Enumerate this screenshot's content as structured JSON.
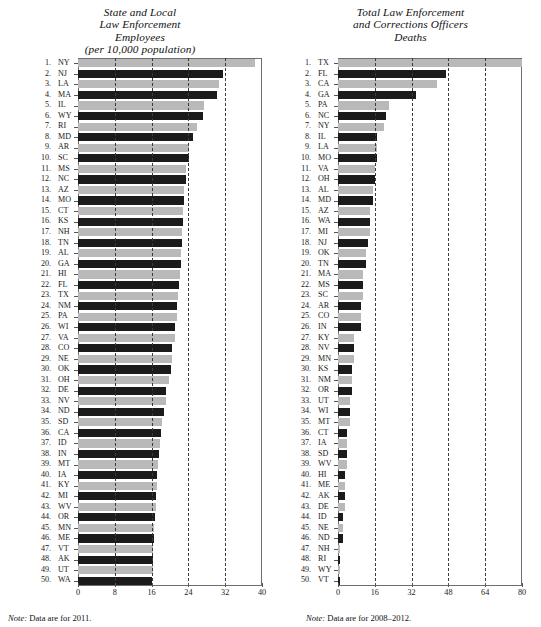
{
  "left_panel": {
    "title_lines": [
      "State and Local",
      "Law Enforcement",
      "Employees",
      "(per 10,000 population)"
    ],
    "note_label": "Note:",
    "note_text": " Data are for 2011."
  },
  "right_panel": {
    "title_lines": [
      "Total Law Enforcement",
      "and Corrections Officers",
      "Deaths"
    ],
    "note_label": "Note:",
    "note_text": " Data are for 2008–2012."
  },
  "chart_data": [
    {
      "type": "bar",
      "orientation": "horizontal",
      "title": "State and Local Law Enforcement Employees (per 10,000 population)",
      "xlabel": "",
      "ylabel": "",
      "xlim": [
        0,
        40
      ],
      "xticks": [
        0,
        8,
        16,
        24,
        32,
        40
      ],
      "grid": "vertical dashed at 8, 16, 24, 32",
      "legend": "none",
      "note": "Data are for 2011.",
      "categories": [
        "NY",
        "NJ",
        "LA",
        "MA",
        "IL",
        "WY",
        "RI",
        "MD",
        "AR",
        "SC",
        "MS",
        "NC",
        "AZ",
        "MO",
        "CT",
        "KS",
        "NH",
        "TN",
        "AL",
        "GA",
        "HI",
        "FL",
        "TX",
        "NM",
        "PA",
        "WI",
        "VA",
        "CO",
        "NE",
        "OK",
        "OH",
        "DE",
        "NV",
        "ND",
        "SD",
        "CA",
        "ID",
        "IN",
        "MT",
        "IA",
        "KY",
        "MI",
        "WV",
        "OR",
        "MN",
        "ME",
        "VT",
        "AK",
        "UT",
        "WA"
      ],
      "ranks": [
        1,
        2,
        3,
        4,
        5,
        6,
        7,
        8,
        9,
        10,
        11,
        12,
        13,
        14,
        15,
        16,
        17,
        18,
        19,
        20,
        21,
        22,
        23,
        24,
        25,
        26,
        27,
        28,
        29,
        30,
        31,
        32,
        33,
        34,
        35,
        36,
        37,
        38,
        39,
        40,
        41,
        42,
        43,
        44,
        45,
        46,
        47,
        48,
        49,
        50
      ],
      "values": [
        38.5,
        31.5,
        30.6,
        30.3,
        27.3,
        27.2,
        25.8,
        25.0,
        24.2,
        24.1,
        23.4,
        23.4,
        23.1,
        23.1,
        22.8,
        22.8,
        22.6,
        22.6,
        22.4,
        22.3,
        22.1,
        22.0,
        21.8,
        21.6,
        21.5,
        21.1,
        21.0,
        20.5,
        20.4,
        20.3,
        19.7,
        19.2,
        19.1,
        18.8,
        18.3,
        18.0,
        17.8,
        17.6,
        17.4,
        17.2,
        17.1,
        17.0,
        16.9,
        16.8,
        16.6,
        16.5,
        16.4,
        16.3,
        16.2,
        16.0
      ],
      "bar_shades": [
        "light",
        "dark",
        "light",
        "dark",
        "light",
        "dark",
        "light",
        "dark",
        "light",
        "dark",
        "light",
        "dark",
        "light",
        "dark",
        "light",
        "dark",
        "light",
        "dark",
        "light",
        "dark",
        "light",
        "dark",
        "light",
        "dark",
        "light",
        "dark",
        "light",
        "dark",
        "light",
        "dark",
        "light",
        "dark",
        "light",
        "dark",
        "light",
        "dark",
        "light",
        "dark",
        "light",
        "dark",
        "light",
        "dark",
        "light",
        "dark",
        "light",
        "dark",
        "light",
        "dark",
        "light",
        "dark"
      ]
    },
    {
      "type": "bar",
      "orientation": "horizontal",
      "title": "Total Law Enforcement and Corrections Officers Deaths",
      "xlabel": "",
      "ylabel": "",
      "xlim": [
        0,
        80
      ],
      "xticks": [
        0,
        16,
        32,
        48,
        64,
        80
      ],
      "grid": "vertical dashed at 16, 32, 48, 64",
      "legend": "none",
      "note": "Data are for 2008–2012.",
      "categories": [
        "TX",
        "FL",
        "CA",
        "GA",
        "PA",
        "NC",
        "NY",
        "IL",
        "LA",
        "MO",
        "VA",
        "OH",
        "AL",
        "MD",
        "AZ",
        "WA",
        "MI",
        "NJ",
        "OK",
        "TN",
        "MA",
        "MS",
        "SC",
        "AR",
        "CO",
        "IN",
        "KY",
        "NV",
        "MN",
        "KS",
        "NM",
        "OR",
        "UT",
        "WI",
        "MT",
        "CT",
        "IA",
        "SD",
        "WV",
        "HI",
        "ME",
        "AK",
        "DE",
        "ID",
        "NE",
        "ND",
        "NH",
        "RI",
        "WY",
        "VT"
      ],
      "ranks": [
        1,
        2,
        3,
        4,
        5,
        6,
        7,
        8,
        9,
        10,
        11,
        12,
        13,
        14,
        15,
        16,
        17,
        18,
        19,
        20,
        21,
        22,
        23,
        24,
        25,
        26,
        27,
        28,
        29,
        30,
        31,
        32,
        33,
        34,
        35,
        36,
        37,
        38,
        39,
        40,
        41,
        42,
        43,
        44,
        45,
        46,
        47,
        48,
        49,
        50
      ],
      "values": [
        80,
        47,
        43,
        34,
        22,
        21,
        20,
        17,
        17,
        17,
        16,
        16,
        15,
        15,
        14,
        14,
        14,
        13,
        12,
        12,
        11,
        11,
        11,
        10,
        10,
        10,
        7,
        7,
        7,
        6,
        6,
        6,
        5,
        5,
        5,
        4,
        4,
        4,
        4,
        3,
        3,
        3,
        3,
        2,
        2,
        2,
        1,
        1,
        1,
        1
      ],
      "bar_shades": [
        "light",
        "dark",
        "light",
        "dark",
        "light",
        "dark",
        "light",
        "dark",
        "light",
        "dark",
        "light",
        "dark",
        "light",
        "dark",
        "light",
        "dark",
        "light",
        "dark",
        "light",
        "dark",
        "light",
        "dark",
        "light",
        "dark",
        "light",
        "dark",
        "light",
        "dark",
        "light",
        "dark",
        "light",
        "dark",
        "light",
        "dark",
        "light",
        "dark",
        "light",
        "dark",
        "light",
        "dark",
        "light",
        "dark",
        "light",
        "dark",
        "light",
        "dark",
        "light",
        "dark",
        "light",
        "dark"
      ]
    }
  ]
}
